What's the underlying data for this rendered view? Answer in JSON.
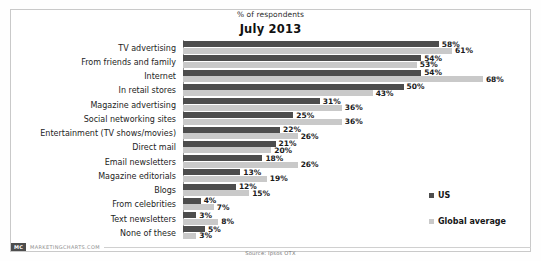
{
  "header": {
    "subtitle": "% of respondents",
    "title": "July 2013"
  },
  "legend": {
    "items": [
      {
        "label": "US",
        "color": "#4d4d4d"
      },
      {
        "label": "Global average",
        "color": "#c9c9c9"
      }
    ]
  },
  "footer": {
    "brand_badge": "MC",
    "brand_text": "MARKETINGCHARTS.COM",
    "source": "Source: Ipsos OTX"
  },
  "chart_data": {
    "type": "bar",
    "orientation": "horizontal",
    "title": "July 2013",
    "subtitle": "% of respondents",
    "xlabel": "% of respondents",
    "ylabel": "",
    "xlim": [
      0,
      70
    ],
    "grid": false,
    "legend_position": "right",
    "value_suffix": "%",
    "categories": [
      "TV advertising",
      "From friends and family",
      "Internet",
      "In retail stores",
      "Magazine advertising",
      "Social networking sites",
      "Entertainment (TV shows/movies)",
      "Direct mail",
      "Email newsletters",
      "Magazine editorials",
      "Blogs",
      "From celebrities",
      "Text newsletters",
      "None of these"
    ],
    "series": [
      {
        "name": "US",
        "color": "#4d4d4d",
        "values": [
          58,
          54,
          54,
          50,
          31,
          25,
          22,
          21,
          18,
          13,
          12,
          4,
          3,
          5
        ],
        "labels": [
          "58%",
          "54%",
          "54%",
          "50%",
          "31%",
          "25%",
          "22%",
          "21%",
          "18%",
          "13%",
          "12%",
          "4%",
          "3%",
          "5%"
        ]
      },
      {
        "name": "Global average",
        "color": "#c9c9c9",
        "values": [
          61,
          53,
          68,
          43,
          36,
          36,
          26,
          20,
          26,
          19,
          15,
          7,
          8,
          3
        ],
        "labels": [
          "61%",
          "53%",
          "68%",
          "43%",
          "36%",
          "36%",
          "26%",
          "20%",
          "26%",
          "19%",
          "15%",
          "7%",
          "8%",
          "3%"
        ]
      }
    ]
  }
}
